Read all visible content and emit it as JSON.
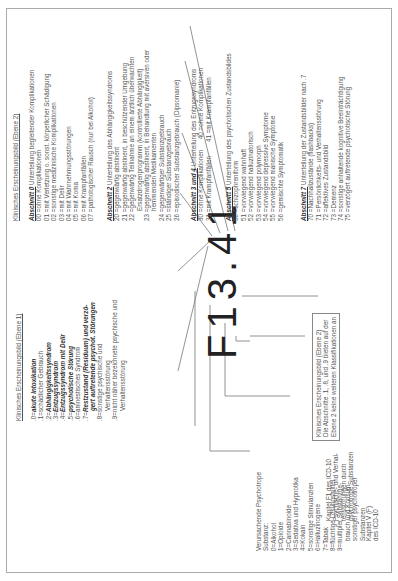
{
  "code": "F13.41",
  "substance": {
    "title": "Verursachende Psychotrope",
    "items": [
      "Substanz:",
      "0=Alkohol",
      "1=Opioide",
      "2=Cannabinoide",
      "3=Sedativa und Hypnotika",
      "4=Kokain",
      "5=sonstige Stimulanzien",
      "6=Halluzinogene",
      "7=Tabak",
      "8=flüchtige Lösungsmittel",
      "9=multipler Substanzge-",
      "brauch und Konsum",
      "sonstiger psychotroper",
      "Substanzen"
    ]
  },
  "chapter_f1": [
    "Kapitel F1 des ICD-10",
    "Psychische- und Verhal-",
    "tensstörungen durch",
    "psychotrope Substanzen"
  ],
  "chapter_v": [
    "Kapitel V (F)",
    "des ICD-10"
  ],
  "ebene1": {
    "title": "Klinisches Erscheinungsbild (Ebene 1)",
    "items": [
      {
        "k": ".0=",
        "t": "akute Intoxikation",
        "s": "bi"
      },
      {
        "k": ".1=",
        "t": "schädlicher Gebrauch",
        "s": ""
      },
      {
        "k": ".2=",
        "t": "Abhängigkeitssyndrom",
        "s": "bi"
      },
      {
        "k": ".3=",
        "t": "Entzugssyndrom",
        "s": "bi"
      },
      {
        "k": ".4=",
        "t": "Entzugssyndrom mit Delir",
        "s": "bi"
      },
      {
        "k": ".5=",
        "t": "psychotische Störung",
        "s": "bi"
      },
      {
        "k": ".6=",
        "t": "amnestisches Syndrom",
        "s": ""
      },
      {
        "k": ".7=",
        "t": "Restzustand (Residuum) und verzö-",
        "s": "bi"
      },
      {
        "k": "",
        "t": "gert auftretende psychot. Störungen",
        "s": "bi"
      },
      {
        "k": ".8=",
        "t": "sonstige psychische und",
        "s": ""
      },
      {
        "k": "",
        "t": "Verhaltensstörung",
        "s": ""
      },
      {
        "k": ".9=",
        "t": "nicht näher bezeichnete psychische und",
        "s": ""
      },
      {
        "k": "",
        "t": "Verhaltensstörung",
        "s": ""
      }
    ]
  },
  "note": [
    "Klinisches Erscheinungsbild (Ebene 2)",
    "Die Abschnitte .1, .8, und .9 bieten auf der",
    "Ebene 2 keine weiteren Klassifikationen an"
  ],
  "ebene2": {
    "title": "Klinisches Erscheinungsbild (Ebene 2)",
    "a0": {
      "label": "Abschnitt 0",
      "heading": "Unterteilung begleitender Komplikationen",
      "items": [
        "00 =ohne Komplikationen",
        "01 =mit Verletzung o. sonst. körperlicher Schädigung",
        "02 =sonstige medizinische Komplikationen",
        "03 =mit Delir",
        "04 =mit Wahrnehmungsstörungen",
        "05 =mit Koma",
        "06 =mit Krampfanfällen",
        "07 =pathologischer Rausch (nur bei Alkohol)"
      ]
    },
    "a2": {
      "label": "Abschnitt 2",
      "heading": "Unterteilung des Abhängigkeitssyndroms",
      "items": [
        "20 =gegenwärtig abstinent",
        "21 =gegenwärtig abstinent, in beschützender Umgebung",
        "22 =gegenwärtig Teilnahme an einem ärztlich überwachten",
        "     Ersatzdrogenprogramm (kontrollierte Abhängigkeit)",
        "23 =gegenwärtig abstinent, in Behandlung mit aversiven oder",
        "     hemmenden Medikamenten",
        "24 =gegenwärtiger Substanzgebrauch",
        "25 =ständiger Substanzgebrauch",
        "26 =episodischer Substanzgebrauch (Dipsomanie)"
      ]
    },
    "a34": {
      "label": "Abschnitt 3 und 4",
      "heading": "Unterteilung des Entzugssyndroms",
      "items": [
        "30 =ohne Komplikationen      40 =ohne Komplikationen",
        "31 =mit Krampfanfällen        41 =mit Krampfanfällen"
      ]
    },
    "a5": {
      "label": "Abschnitt 5",
      "heading": "Unterteilung des psychotischen Zustandsbildes",
      "items": [
        "50 =schizophreniform",
        "51 =vorwiegend wahnhaft",
        "52 =vorwiegend halluzinatorisch",
        "53 =vorwiegend polymorph",
        "54 =vorwiegend depressive Symptome",
        "55 =vorwiegend manische Symptome",
        "56 =gemischte Symptomatik"
      ]
    },
    "a7": {
      "label": "Abschnitt 7",
      "heading": "Unterteilung der Zustandsbilder nach .7",
      "items": [
        "70 =Nachhallzustände (flashbacks)",
        "71 =Persönlichkeits- und Verhaltensstörung",
        "72 =affektives Zustandsbild",
        "73 =Demenz",
        "74 =sonstige anhaltende kognitive Beeinträchtigung",
        "75 =verzögert auftretende psychotische Störung"
      ]
    }
  }
}
